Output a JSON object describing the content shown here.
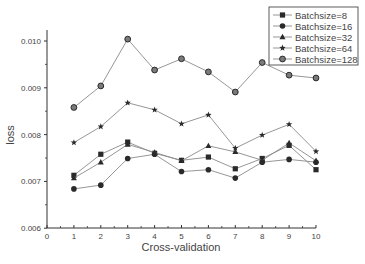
{
  "chart_data": {
    "type": "line",
    "title": "",
    "xlabel": "Cross-validation",
    "ylabel": "loss",
    "xlim": [
      0,
      10
    ],
    "ylim": [
      0.006,
      0.0103
    ],
    "x_ticks": [
      "0",
      "1",
      "2",
      "3",
      "4",
      "5",
      "6",
      "7",
      "8",
      "9",
      "10"
    ],
    "y_ticks": [
      "0.006",
      "0.007",
      "0.008",
      "0.009",
      "0.010"
    ],
    "grid": false,
    "legend_position": "upper right",
    "x": [
      1,
      2,
      3,
      4,
      5,
      6,
      7,
      8,
      9,
      10
    ],
    "series": [
      {
        "name": "Batchsize=8",
        "marker": "square",
        "values": [
          0.00713,
          0.00758,
          0.00784,
          0.0076,
          0.00745,
          0.00752,
          0.00727,
          0.00749,
          0.00777,
          0.00725
        ]
      },
      {
        "name": "Batchsize=16",
        "marker": "circle",
        "values": [
          0.00684,
          0.00692,
          0.00749,
          0.00758,
          0.00721,
          0.00725,
          0.00707,
          0.00741,
          0.00747,
          0.00741
        ]
      },
      {
        "name": "Batchsize=32",
        "marker": "triangle",
        "values": [
          0.00707,
          0.00741,
          0.00779,
          0.00762,
          0.00744,
          0.00776,
          0.00763,
          0.00745,
          0.00782,
          0.00744
        ]
      },
      {
        "name": "Batchsize=64",
        "marker": "star",
        "values": [
          0.00783,
          0.00817,
          0.00868,
          0.00853,
          0.00823,
          0.00842,
          0.00771,
          0.00799,
          0.00822,
          0.00764
        ]
      },
      {
        "name": "Batchsize=128",
        "marker": "circle-gray",
        "values": [
          0.00858,
          0.00904,
          0.01004,
          0.00938,
          0.00962,
          0.00934,
          0.00891,
          0.00954,
          0.00927,
          0.00921
        ]
      }
    ]
  },
  "colors": {
    "line": "#8a8a8a",
    "marker": "#2a2a2a",
    "marker_128_fill": "#7a7a7a",
    "axis": "#333333",
    "text": "#444444"
  }
}
